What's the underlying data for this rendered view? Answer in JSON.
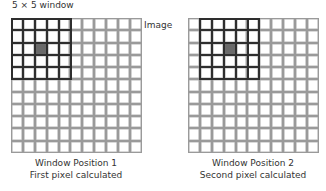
{
  "labels": {
    "window_label": "5 × 5 window",
    "image_label": "Image"
  },
  "grid": {
    "rows": 11,
    "cols": 11,
    "window_size": 5
  },
  "panels": [
    {
      "id": "position-1",
      "window_col": 0,
      "window_row": 0,
      "caption_line1": "Window Position 1",
      "caption_line2": "First pixel calculated"
    },
    {
      "id": "position-2",
      "window_col": 1,
      "window_row": 0,
      "caption_line1": "Window Position 2",
      "caption_line2": "Second pixel calculated"
    }
  ],
  "colors": {
    "grid_line": "#9a9a9a",
    "window_border": "#2e2e2e",
    "center_pixel": "#6a6a6a"
  }
}
